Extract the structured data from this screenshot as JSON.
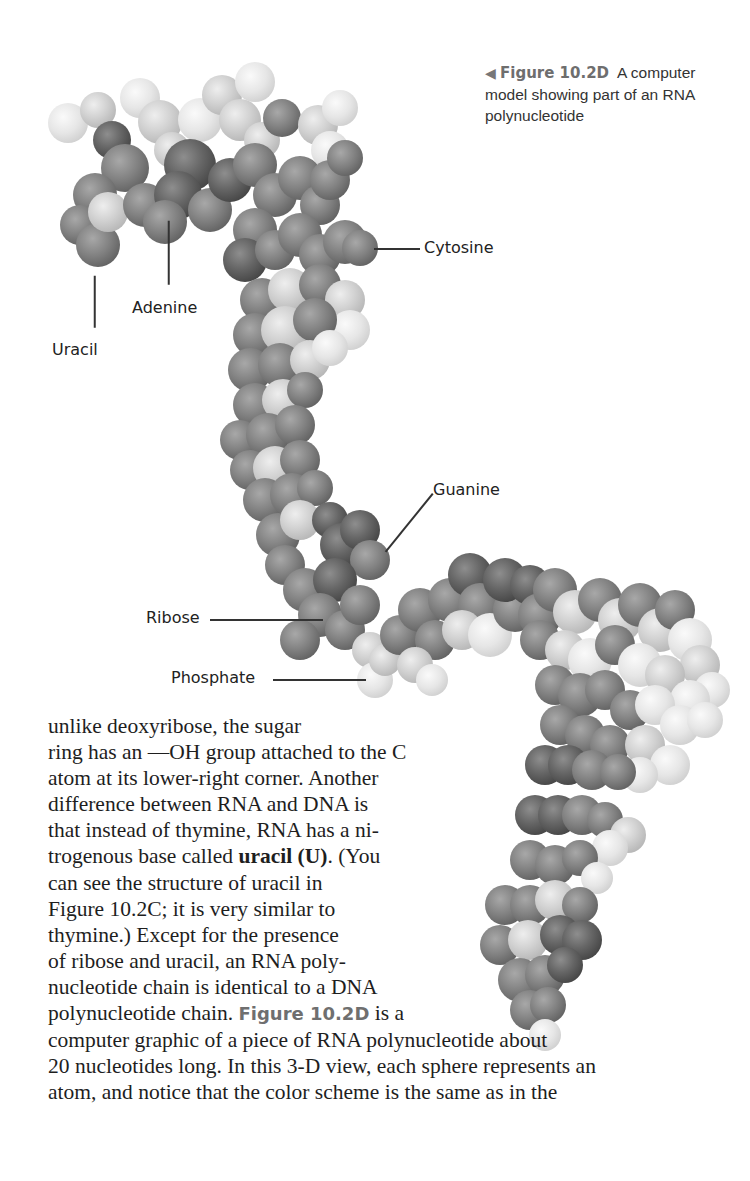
{
  "figure": {
    "caption": {
      "arrow_icon": "◀",
      "figure_number": "Figure 10.2D",
      "lines": [
        "A computer",
        "model showing part of an RNA",
        "polynucleotide"
      ]
    },
    "labels": [
      {
        "id": "uracil",
        "text": "Uracil",
        "x": 52,
        "y": 340,
        "line": {
          "x1": 95,
          "y1": 275,
          "x2": 95,
          "y2": 327
        }
      },
      {
        "id": "adenine",
        "text": "Adenine",
        "x": 132,
        "y": 298,
        "line": {
          "x1": 169,
          "y1": 220,
          "x2": 169,
          "y2": 284
        }
      },
      {
        "id": "cytosine",
        "text": "Cytosine",
        "x": 424,
        "y": 238,
        "line": {
          "x1": 374,
          "y1": 248,
          "x2": 420,
          "y2": 248
        }
      },
      {
        "id": "guanine",
        "text": "Guanine",
        "x": 433,
        "y": 480,
        "line": {
          "x1": 433,
          "y1": 493,
          "x2": 386,
          "y2": 551
        }
      },
      {
        "id": "ribose",
        "text": "Ribose",
        "x": 146,
        "y": 608,
        "line": {
          "x1": 210,
          "y1": 619,
          "x2": 323,
          "y2": 619
        }
      },
      {
        "id": "phosphate",
        "text": "Phosphate",
        "x": 171,
        "y": 668,
        "line": {
          "x1": 273,
          "y1": 679,
          "x2": 366,
          "y2": 679
        }
      }
    ],
    "atoms": [
      {
        "x": 68,
        "y": 123,
        "r": 20,
        "s": "w"
      },
      {
        "x": 98,
        "y": 110,
        "r": 18,
        "s": "l"
      },
      {
        "x": 112,
        "y": 140,
        "r": 19,
        "s": "d"
      },
      {
        "x": 140,
        "y": 98,
        "r": 20,
        "s": "w"
      },
      {
        "x": 160,
        "y": 122,
        "r": 22,
        "s": "l"
      },
      {
        "x": 172,
        "y": 150,
        "r": 18,
        "s": "l"
      },
      {
        "x": 200,
        "y": 120,
        "r": 22,
        "s": "w"
      },
      {
        "x": 222,
        "y": 95,
        "r": 20,
        "s": "l"
      },
      {
        "x": 240,
        "y": 120,
        "r": 21,
        "s": "l"
      },
      {
        "x": 255,
        "y": 82,
        "r": 20,
        "s": "w"
      },
      {
        "x": 262,
        "y": 140,
        "r": 18,
        "s": "l"
      },
      {
        "x": 282,
        "y": 118,
        "r": 19,
        "s": "m"
      },
      {
        "x": 318,
        "y": 125,
        "r": 20,
        "s": "l"
      },
      {
        "x": 330,
        "y": 150,
        "r": 19,
        "s": "w"
      },
      {
        "x": 340,
        "y": 108,
        "r": 18,
        "s": "w"
      },
      {
        "x": 125,
        "y": 168,
        "r": 24,
        "s": "m"
      },
      {
        "x": 95,
        "y": 195,
        "r": 22,
        "s": "m"
      },
      {
        "x": 80,
        "y": 225,
        "r": 20,
        "s": "m"
      },
      {
        "x": 98,
        "y": 245,
        "r": 22,
        "s": "m"
      },
      {
        "x": 108,
        "y": 212,
        "r": 20,
        "s": "l"
      },
      {
        "x": 145,
        "y": 205,
        "r": 22,
        "s": "m"
      },
      {
        "x": 190,
        "y": 165,
        "r": 26,
        "s": "d"
      },
      {
        "x": 178,
        "y": 195,
        "r": 24,
        "s": "d"
      },
      {
        "x": 165,
        "y": 222,
        "r": 22,
        "s": "m"
      },
      {
        "x": 210,
        "y": 210,
        "r": 22,
        "s": "m"
      },
      {
        "x": 230,
        "y": 180,
        "r": 22,
        "s": "d"
      },
      {
        "x": 255,
        "y": 165,
        "r": 22,
        "s": "m"
      },
      {
        "x": 275,
        "y": 195,
        "r": 22,
        "s": "m"
      },
      {
        "x": 300,
        "y": 178,
        "r": 22,
        "s": "m"
      },
      {
        "x": 320,
        "y": 205,
        "r": 20,
        "s": "m"
      },
      {
        "x": 330,
        "y": 180,
        "r": 20,
        "s": "m"
      },
      {
        "x": 345,
        "y": 158,
        "r": 18,
        "s": "m"
      },
      {
        "x": 255,
        "y": 230,
        "r": 22,
        "s": "m"
      },
      {
        "x": 245,
        "y": 260,
        "r": 22,
        "s": "d"
      },
      {
        "x": 275,
        "y": 250,
        "r": 20,
        "s": "m"
      },
      {
        "x": 300,
        "y": 235,
        "r": 22,
        "s": "m"
      },
      {
        "x": 320,
        "y": 255,
        "r": 21,
        "s": "m"
      },
      {
        "x": 345,
        "y": 242,
        "r": 22,
        "s": "m"
      },
      {
        "x": 360,
        "y": 248,
        "r": 18,
        "s": "m"
      },
      {
        "x": 262,
        "y": 300,
        "r": 22,
        "s": "m"
      },
      {
        "x": 290,
        "y": 290,
        "r": 22,
        "s": "l"
      },
      {
        "x": 320,
        "y": 285,
        "r": 21,
        "s": "m"
      },
      {
        "x": 345,
        "y": 300,
        "r": 20,
        "s": "l"
      },
      {
        "x": 350,
        "y": 330,
        "r": 20,
        "s": "w"
      },
      {
        "x": 255,
        "y": 335,
        "r": 22,
        "s": "m"
      },
      {
        "x": 285,
        "y": 330,
        "r": 24,
        "s": "l"
      },
      {
        "x": 315,
        "y": 320,
        "r": 22,
        "s": "m"
      },
      {
        "x": 250,
        "y": 370,
        "r": 22,
        "s": "m"
      },
      {
        "x": 280,
        "y": 365,
        "r": 22,
        "s": "m"
      },
      {
        "x": 310,
        "y": 360,
        "r": 20,
        "s": "l"
      },
      {
        "x": 330,
        "y": 348,
        "r": 18,
        "s": "w"
      },
      {
        "x": 255,
        "y": 405,
        "r": 22,
        "s": "m"
      },
      {
        "x": 283,
        "y": 400,
        "r": 21,
        "s": "l"
      },
      {
        "x": 305,
        "y": 390,
        "r": 18,
        "s": "m"
      },
      {
        "x": 240,
        "y": 440,
        "r": 20,
        "s": "m"
      },
      {
        "x": 268,
        "y": 435,
        "r": 22,
        "s": "m"
      },
      {
        "x": 295,
        "y": 425,
        "r": 20,
        "s": "m"
      },
      {
        "x": 250,
        "y": 470,
        "r": 20,
        "s": "m"
      },
      {
        "x": 275,
        "y": 468,
        "r": 22,
        "s": "l"
      },
      {
        "x": 300,
        "y": 460,
        "r": 20,
        "s": "m"
      },
      {
        "x": 265,
        "y": 500,
        "r": 22,
        "s": "m"
      },
      {
        "x": 292,
        "y": 495,
        "r": 22,
        "s": "m"
      },
      {
        "x": 315,
        "y": 488,
        "r": 18,
        "s": "m"
      },
      {
        "x": 278,
        "y": 535,
        "r": 22,
        "s": "m"
      },
      {
        "x": 300,
        "y": 520,
        "r": 20,
        "s": "l"
      },
      {
        "x": 330,
        "y": 520,
        "r": 18,
        "s": "d"
      },
      {
        "x": 342,
        "y": 545,
        "r": 22,
        "s": "d"
      },
      {
        "x": 360,
        "y": 530,
        "r": 20,
        "s": "d"
      },
      {
        "x": 370,
        "y": 560,
        "r": 20,
        "s": "m"
      },
      {
        "x": 285,
        "y": 565,
        "r": 20,
        "s": "m"
      },
      {
        "x": 305,
        "y": 590,
        "r": 22,
        "s": "m"
      },
      {
        "x": 335,
        "y": 580,
        "r": 22,
        "s": "d"
      },
      {
        "x": 320,
        "y": 615,
        "r": 22,
        "s": "m"
      },
      {
        "x": 345,
        "y": 630,
        "r": 20,
        "s": "m"
      },
      {
        "x": 360,
        "y": 605,
        "r": 20,
        "s": "m"
      },
      {
        "x": 300,
        "y": 640,
        "r": 20,
        "s": "m"
      },
      {
        "x": 370,
        "y": 650,
        "r": 18,
        "s": "l"
      },
      {
        "x": 375,
        "y": 680,
        "r": 18,
        "s": "w"
      },
      {
        "x": 385,
        "y": 660,
        "r": 16,
        "s": "l"
      },
      {
        "x": 400,
        "y": 635,
        "r": 20,
        "s": "m"
      },
      {
        "x": 420,
        "y": 610,
        "r": 22,
        "s": "m"
      },
      {
        "x": 435,
        "y": 640,
        "r": 20,
        "s": "m"
      },
      {
        "x": 415,
        "y": 665,
        "r": 18,
        "s": "l"
      },
      {
        "x": 432,
        "y": 680,
        "r": 16,
        "s": "w"
      },
      {
        "x": 450,
        "y": 600,
        "r": 22,
        "s": "m"
      },
      {
        "x": 470,
        "y": 575,
        "r": 22,
        "s": "d"
      },
      {
        "x": 480,
        "y": 605,
        "r": 22,
        "s": "m"
      },
      {
        "x": 462,
        "y": 630,
        "r": 20,
        "s": "l"
      },
      {
        "x": 490,
        "y": 635,
        "r": 22,
        "s": "w"
      },
      {
        "x": 515,
        "y": 610,
        "r": 22,
        "s": "m"
      },
      {
        "x": 505,
        "y": 580,
        "r": 22,
        "s": "d"
      },
      {
        "x": 530,
        "y": 585,
        "r": 20,
        "s": "d"
      },
      {
        "x": 540,
        "y": 615,
        "r": 22,
        "s": "m"
      },
      {
        "x": 555,
        "y": 590,
        "r": 22,
        "s": "m"
      },
      {
        "x": 575,
        "y": 612,
        "r": 22,
        "s": "l"
      },
      {
        "x": 600,
        "y": 600,
        "r": 22,
        "s": "m"
      },
      {
        "x": 620,
        "y": 620,
        "r": 22,
        "s": "l"
      },
      {
        "x": 640,
        "y": 605,
        "r": 22,
        "s": "m"
      },
      {
        "x": 660,
        "y": 630,
        "r": 22,
        "s": "l"
      },
      {
        "x": 675,
        "y": 610,
        "r": 20,
        "s": "m"
      },
      {
        "x": 690,
        "y": 640,
        "r": 22,
        "s": "w"
      },
      {
        "x": 700,
        "y": 665,
        "r": 20,
        "s": "l"
      },
      {
        "x": 712,
        "y": 690,
        "r": 18,
        "s": "w"
      },
      {
        "x": 540,
        "y": 640,
        "r": 20,
        "s": "m"
      },
      {
        "x": 565,
        "y": 650,
        "r": 20,
        "s": "l"
      },
      {
        "x": 590,
        "y": 660,
        "r": 22,
        "s": "w"
      },
      {
        "x": 615,
        "y": 645,
        "r": 20,
        "s": "m"
      },
      {
        "x": 640,
        "y": 665,
        "r": 22,
        "s": "w"
      },
      {
        "x": 665,
        "y": 675,
        "r": 20,
        "s": "l"
      },
      {
        "x": 690,
        "y": 700,
        "r": 20,
        "s": "w"
      },
      {
        "x": 555,
        "y": 685,
        "r": 20,
        "s": "m"
      },
      {
        "x": 580,
        "y": 695,
        "r": 22,
        "s": "m"
      },
      {
        "x": 605,
        "y": 690,
        "r": 20,
        "s": "m"
      },
      {
        "x": 630,
        "y": 710,
        "r": 20,
        "s": "m"
      },
      {
        "x": 655,
        "y": 705,
        "r": 20,
        "s": "w"
      },
      {
        "x": 680,
        "y": 725,
        "r": 20,
        "s": "w"
      },
      {
        "x": 705,
        "y": 720,
        "r": 18,
        "s": "w"
      },
      {
        "x": 560,
        "y": 725,
        "r": 20,
        "s": "m"
      },
      {
        "x": 585,
        "y": 735,
        "r": 20,
        "s": "m"
      },
      {
        "x": 610,
        "y": 745,
        "r": 20,
        "s": "m"
      },
      {
        "x": 645,
        "y": 745,
        "r": 20,
        "s": "l"
      },
      {
        "x": 670,
        "y": 765,
        "r": 20,
        "s": "w"
      },
      {
        "x": 640,
        "y": 775,
        "r": 18,
        "s": "w"
      },
      {
        "x": 545,
        "y": 765,
        "r": 20,
        "s": "d"
      },
      {
        "x": 568,
        "y": 765,
        "r": 20,
        "s": "d"
      },
      {
        "x": 592,
        "y": 770,
        "r": 20,
        "s": "m"
      },
      {
        "x": 618,
        "y": 772,
        "r": 18,
        "s": "m"
      },
      {
        "x": 535,
        "y": 815,
        "r": 20,
        "s": "d"
      },
      {
        "x": 558,
        "y": 815,
        "r": 20,
        "s": "d"
      },
      {
        "x": 582,
        "y": 815,
        "r": 20,
        "s": "m"
      },
      {
        "x": 605,
        "y": 820,
        "r": 18,
        "s": "m"
      },
      {
        "x": 628,
        "y": 835,
        "r": 18,
        "s": "l"
      },
      {
        "x": 610,
        "y": 848,
        "r": 18,
        "s": "w"
      },
      {
        "x": 530,
        "y": 860,
        "r": 20,
        "s": "m"
      },
      {
        "x": 555,
        "y": 865,
        "r": 20,
        "s": "m"
      },
      {
        "x": 580,
        "y": 858,
        "r": 18,
        "s": "m"
      },
      {
        "x": 597,
        "y": 878,
        "r": 16,
        "s": "w"
      },
      {
        "x": 505,
        "y": 905,
        "r": 20,
        "s": "m"
      },
      {
        "x": 530,
        "y": 905,
        "r": 20,
        "s": "m"
      },
      {
        "x": 555,
        "y": 900,
        "r": 20,
        "s": "l"
      },
      {
        "x": 580,
        "y": 905,
        "r": 18,
        "s": "m"
      },
      {
        "x": 500,
        "y": 945,
        "r": 20,
        "s": "m"
      },
      {
        "x": 528,
        "y": 940,
        "r": 20,
        "s": "l"
      },
      {
        "x": 560,
        "y": 935,
        "r": 20,
        "s": "d"
      },
      {
        "x": 582,
        "y": 940,
        "r": 20,
        "s": "d"
      },
      {
        "x": 520,
        "y": 980,
        "r": 22,
        "s": "m"
      },
      {
        "x": 545,
        "y": 975,
        "r": 20,
        "s": "m"
      },
      {
        "x": 565,
        "y": 965,
        "r": 18,
        "s": "d"
      },
      {
        "x": 530,
        "y": 1010,
        "r": 20,
        "s": "m"
      },
      {
        "x": 548,
        "y": 1005,
        "r": 18,
        "s": "m"
      },
      {
        "x": 545,
        "y": 1035,
        "r": 16,
        "s": "w"
      }
    ]
  },
  "body_text": {
    "lines": [
      "unlike deoxyribose, the sugar",
      "ring has an —OH group attached to the C",
      "atom at its lower-right corner. Another",
      "difference between RNA and DNA is",
      "that instead of thymine, RNA has a ni-",
      "trogenous base called ",
      "can see the structure of uracil in",
      "Figure 10.2C; it is very similar to",
      "thymine.) Except for the presence",
      "of ribose and uracil, an RNA poly-",
      "nucleotide chain is identical to a DNA",
      "polynucleotide chain. ",
      "computer graphic of a piece of RNA polynucleotide about",
      "20 nucleotides long. In this 3-D view, each sphere represents an",
      "atom, and notice that the color scheme is the same as in the"
    ],
    "bold_term": "uracil (U)",
    "after_bold": ". (You",
    "figure_ref": "Figure 10.2D",
    "after_figure_ref": " is a"
  }
}
